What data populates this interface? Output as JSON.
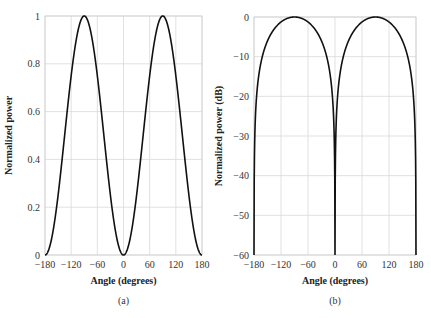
{
  "chart_data": [
    {
      "type": "line",
      "panel": "(a)",
      "title": "",
      "xlabel": "Angle (degrees)",
      "ylabel": "Normalized power",
      "xlim": [
        -180,
        180
      ],
      "ylim": [
        0,
        1
      ],
      "xticks": [
        -180,
        -120,
        -60,
        0,
        60,
        120,
        180
      ],
      "xtick_labels": [
        "−180",
        "−120",
        "−60",
        "0",
        "60",
        "120",
        "180"
      ],
      "yticks": [
        0,
        0.2,
        0.4,
        0.6,
        0.8,
        1
      ],
      "ytick_labels": [
        "0",
        "0.2",
        "0.4",
        "0.6",
        "0.8",
        "1"
      ],
      "grid": true,
      "series": [
        {
          "name": "sin^2(angle)",
          "x": [
            -180,
            -150,
            -120,
            -90,
            -60,
            -30,
            0,
            30,
            60,
            90,
            120,
            150,
            180
          ],
          "y": [
            0,
            0.25,
            0.75,
            1,
            0.75,
            0.25,
            0,
            0.25,
            0.75,
            1,
            0.75,
            0.25,
            0
          ]
        }
      ]
    },
    {
      "type": "line",
      "panel": "(b)",
      "title": "",
      "xlabel": "Angle (degrees)",
      "ylabel": "Normalized power (dB)",
      "xlim": [
        -180,
        180
      ],
      "ylim": [
        -60,
        0
      ],
      "xticks": [
        -180,
        -120,
        -60,
        0,
        60,
        120,
        180
      ],
      "xtick_labels": [
        "−180",
        "−120",
        "−60",
        "0",
        "60",
        "120",
        "180"
      ],
      "yticks": [
        0,
        -10,
        -20,
        -30,
        -40,
        -50,
        -60
      ],
      "ytick_labels": [
        "0",
        "−10",
        "−20",
        "−30",
        "−40",
        "−50",
        "−60"
      ],
      "grid": true,
      "series": [
        {
          "name": "10log10(sin^2(angle))",
          "x": [
            -180,
            -150,
            -120,
            -90,
            -60,
            -30,
            0,
            30,
            60,
            90,
            120,
            150,
            180
          ],
          "y": [
            -60,
            -6.0,
            -1.25,
            0,
            -1.25,
            -6.0,
            -60,
            -6.0,
            -1.25,
            0,
            -1.25,
            -6.0,
            -60
          ]
        }
      ]
    }
  ],
  "captions": {
    "a": "(a)",
    "b": "(b)"
  }
}
